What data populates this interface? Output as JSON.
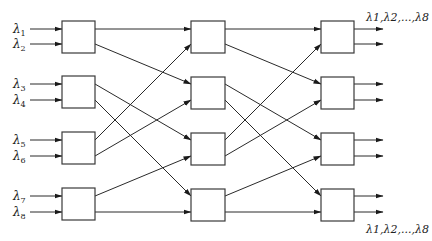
{
  "diagram": {
    "type": "three-stage switching network (wavelength routing)",
    "stages": 3,
    "boxes_per_stage": 4,
    "ports_per_box": 2,
    "inputs": [
      {
        "symbol": "λ",
        "sub": "1"
      },
      {
        "symbol": "λ",
        "sub": "2"
      },
      {
        "symbol": "λ",
        "sub": "3"
      },
      {
        "symbol": "λ",
        "sub": "4"
      },
      {
        "symbol": "λ",
        "sub": "5"
      },
      {
        "symbol": "λ",
        "sub": "6"
      },
      {
        "symbol": "λ",
        "sub": "7"
      },
      {
        "symbol": "λ",
        "sub": "8"
      }
    ],
    "output_labels": {
      "top": "λ1,λ2,...,λ8",
      "bottom": "λ1,λ2,...,λ8"
    },
    "interstage_connections": [
      {
        "from": "box1.out1",
        "to": "box1.in1"
      },
      {
        "from": "box1.out2",
        "to": "box2.in1"
      },
      {
        "from": "box2.out1",
        "to": "box3.in1"
      },
      {
        "from": "box2.out2",
        "to": "box4.in1"
      },
      {
        "from": "box3.out1",
        "to": "box1.in2"
      },
      {
        "from": "box3.out2",
        "to": "box2.in2"
      },
      {
        "from": "box4.out1",
        "to": "box3.in2"
      },
      {
        "from": "box4.out2",
        "to": "box4.in2"
      }
    ],
    "colors": {
      "line": "#2a2a2a",
      "box_stroke": "#3a3a3a",
      "background": "#ffffff"
    }
  }
}
